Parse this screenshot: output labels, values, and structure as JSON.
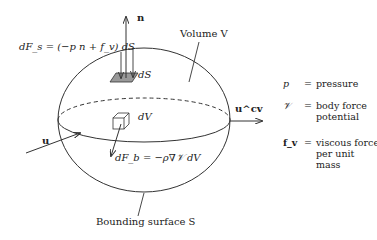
{
  "diagram": {
    "labels": {
      "normal": "n",
      "surface_force": "dF_s = (−p n + f_v) dS",
      "surface_element": "dS",
      "volume": "Volume V",
      "velocity_in": "u",
      "velocity_cv": "u^cv",
      "volume_element": "dV",
      "body_force": "dF_b = −ρ∇𝒱 dV",
      "bounding_surface": "Bounding surface S"
    },
    "legend": [
      {
        "symbol": "p",
        "eq": "=",
        "text": "pressure"
      },
      {
        "symbol": "𝒱",
        "eq": "=",
        "text": "body force potential"
      },
      {
        "symbol": "f_v",
        "eq": "=",
        "text": "viscous force per unit mass"
      }
    ],
    "colors": {
      "line": "#333333",
      "shade": "#999999"
    }
  }
}
